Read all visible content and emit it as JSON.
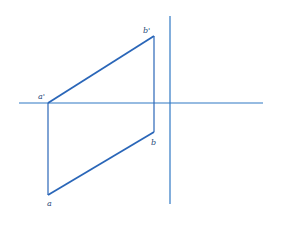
{
  "diagram": {
    "type": "orthographic-projection",
    "colors": {
      "axis": "#2f78c4",
      "line": "#2a66b8",
      "label": "#2a4a7a",
      "background": "#ffffff"
    },
    "axes": {
      "horizontal": {
        "x1": 19,
        "y1": 103,
        "x2": 263,
        "y2": 103
      },
      "vertical": {
        "x1": 170,
        "y1": 16,
        "x2": 170,
        "y2": 204
      }
    },
    "points": {
      "a_prime": {
        "label": "a'",
        "x": 48,
        "y": 103
      },
      "b_prime": {
        "label": "b'",
        "x": 154,
        "y": 36
      },
      "b": {
        "label": "b",
        "x": 154,
        "y": 132
      },
      "a": {
        "label": "a",
        "x": 48,
        "y": 195
      }
    },
    "labels": {
      "a_prime": "a'",
      "b_prime": "b'",
      "b": "b",
      "a": "a"
    }
  }
}
